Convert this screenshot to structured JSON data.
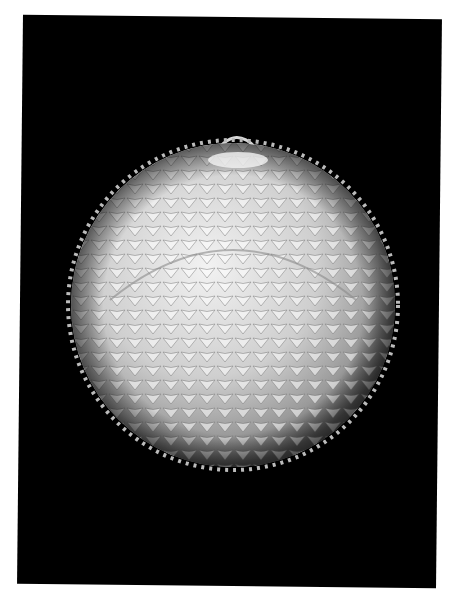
{
  "image": {
    "subject": "spiky white origami sphere (modular folded paper ball with scale-like points)",
    "background_color": "#000000",
    "border_color": "#ffffff",
    "object_color": "#d8d8d8",
    "features": [
      "paper hanging loop on top",
      "rows of pointed triangular scales",
      "ring of folded points at top pole"
    ]
  }
}
